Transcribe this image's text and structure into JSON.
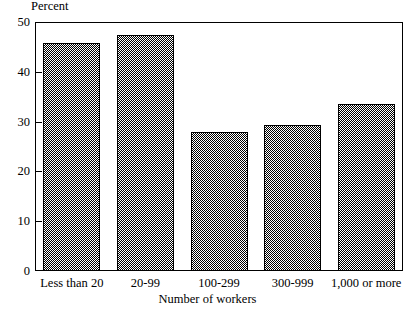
{
  "chart_data": {
    "type": "bar",
    "title": "",
    "ylabel": "Percent",
    "xlabel": "Number of workers",
    "categories": [
      "Less than 20",
      "20-99",
      "100-299",
      "300-999",
      "1,000 or more"
    ],
    "values": [
      45.7,
      47.4,
      27.9,
      29.3,
      33.5
    ],
    "ylim": [
      0,
      50
    ],
    "yticks": [
      "0",
      "10",
      "20",
      "30",
      "40",
      "50"
    ],
    "ytick_values": [
      0,
      10,
      20,
      30,
      40,
      50
    ],
    "grid": false,
    "legend": null,
    "bar_fill": "#808080",
    "bar_edge": "#000000",
    "background": "#ffffff"
  }
}
